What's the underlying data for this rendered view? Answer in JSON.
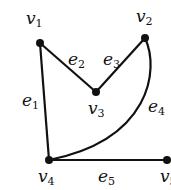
{
  "graph": {
    "vertices": [
      {
        "id": "v1",
        "label": "v",
        "sub": "1",
        "x": 40,
        "y": 43,
        "lx": 26,
        "ly": 24
      },
      {
        "id": "v2",
        "label": "v",
        "sub": "2",
        "x": 145,
        "y": 38,
        "lx": 136,
        "ly": 22
      },
      {
        "id": "v3",
        "label": "v",
        "sub": "3",
        "x": 96,
        "y": 92,
        "lx": 88,
        "ly": 114
      },
      {
        "id": "v4",
        "label": "v",
        "sub": "4",
        "x": 49,
        "y": 160,
        "lx": 38,
        "ly": 182
      },
      {
        "id": "v5",
        "label": "v",
        "sub": "5",
        "x": 167,
        "y": 160,
        "lx": 160,
        "ly": 182
      }
    ],
    "edges": [
      {
        "id": "e1",
        "label": "e",
        "sub": "1",
        "from": "v1",
        "to": "v4",
        "lx": 22,
        "ly": 106
      },
      {
        "id": "e2",
        "label": "e",
        "sub": "2",
        "from": "v1",
        "to": "v3",
        "lx": 68,
        "ly": 65
      },
      {
        "id": "e3",
        "label": "e",
        "sub": "3",
        "from": "v3",
        "to": "v2",
        "lx": 103,
        "ly": 65
      },
      {
        "id": "e4",
        "label": "e",
        "sub": "4",
        "from": "v2",
        "to": "v4",
        "curved": true,
        "lx": 148,
        "ly": 112
      },
      {
        "id": "e5",
        "label": "e",
        "sub": "5",
        "from": "v4",
        "to": "v5",
        "lx": 98,
        "ly": 182
      }
    ]
  }
}
